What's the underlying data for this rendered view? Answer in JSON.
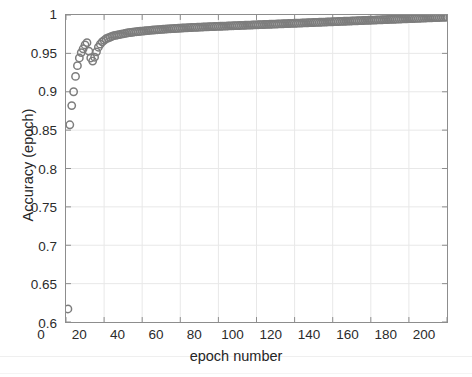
{
  "chart_data": {
    "type": "scatter",
    "title": "",
    "xlabel": "epoch number",
    "ylabel": "Accuracy (epoch)",
    "xlim": [
      0,
      200
    ],
    "ylim": [
      0.6,
      1
    ],
    "xticks": [
      0,
      20,
      40,
      60,
      80,
      100,
      120,
      140,
      160,
      180,
      200
    ],
    "xtick_labels": [
      "0",
      "20",
      "40",
      "60",
      "80",
      "100",
      "120",
      "140",
      "160",
      "180",
      "200"
    ],
    "yticks": [
      0.6,
      0.65,
      0.7,
      0.75,
      0.8,
      0.85,
      0.9,
      0.95,
      1
    ],
    "ytick_labels": [
      "0.6",
      "0.65",
      "0.7",
      "0.75",
      "0.8",
      "0.85",
      "0.9",
      "0.95",
      "1"
    ],
    "grid": true,
    "legend": null,
    "marker": "open-circle",
    "marker_color": "#7d7d7d",
    "marker_size": 5,
    "series": [
      {
        "name": "Accuracy (epoch)",
        "x": [
          1,
          2,
          3,
          4,
          5,
          6,
          7,
          8,
          9,
          10,
          11,
          12,
          13,
          14,
          15,
          16,
          17,
          18,
          19,
          20,
          21,
          22,
          23,
          24,
          25,
          26,
          27,
          28,
          29,
          30,
          31,
          32,
          33,
          34,
          35,
          36,
          37,
          38,
          39,
          40,
          41,
          42,
          43,
          44,
          45,
          46,
          47,
          48,
          49,
          50,
          51,
          52,
          53,
          54,
          55,
          56,
          57,
          58,
          59,
          60,
          61,
          62,
          63,
          64,
          65,
          66,
          67,
          68,
          69,
          70,
          71,
          72,
          73,
          74,
          75,
          76,
          77,
          78,
          79,
          80,
          81,
          82,
          83,
          84,
          85,
          86,
          87,
          88,
          89,
          90,
          91,
          92,
          93,
          94,
          95,
          96,
          97,
          98,
          99,
          100,
          101,
          102,
          103,
          104,
          105,
          106,
          107,
          108,
          109,
          110,
          111,
          112,
          113,
          114,
          115,
          116,
          117,
          118,
          119,
          120,
          121,
          122,
          123,
          124,
          125,
          126,
          127,
          128,
          129,
          130,
          131,
          132,
          133,
          134,
          135,
          136,
          137,
          138,
          139,
          140,
          141,
          142,
          143,
          144,
          145,
          146,
          147,
          148,
          149,
          150,
          151,
          152,
          153,
          154,
          155,
          156,
          157,
          158,
          159,
          160,
          161,
          162,
          163,
          164,
          165,
          166,
          167,
          168,
          169,
          170,
          171,
          172,
          173,
          174,
          175,
          176,
          177,
          178,
          179,
          180,
          181,
          182,
          183,
          184,
          185,
          186,
          187,
          188,
          189,
          190,
          191,
          192,
          193,
          194,
          195,
          196,
          197,
          198,
          199,
          200
        ],
        "y": [
          0.617,
          0.857,
          0.882,
          0.9,
          0.92,
          0.934,
          0.944,
          0.951,
          0.956,
          0.961,
          0.964,
          0.953,
          0.944,
          0.94,
          0.945,
          0.952,
          0.958,
          0.962,
          0.965,
          0.967,
          0.969,
          0.97,
          0.971,
          0.972,
          0.973,
          0.9735,
          0.974,
          0.9745,
          0.975,
          0.9755,
          0.976,
          0.9765,
          0.977,
          0.9772,
          0.9775,
          0.978,
          0.9782,
          0.9785,
          0.9788,
          0.979,
          0.9792,
          0.9795,
          0.9797,
          0.98,
          0.9802,
          0.9804,
          0.9806,
          0.9808,
          0.981,
          0.9812,
          0.9814,
          0.9816,
          0.9818,
          0.982,
          0.9821,
          0.9823,
          0.9824,
          0.9826,
          0.9827,
          0.9829,
          0.983,
          0.9832,
          0.9833,
          0.9834,
          0.9836,
          0.9837,
          0.9838,
          0.9839,
          0.984,
          0.9842,
          0.9843,
          0.9844,
          0.9845,
          0.9846,
          0.9847,
          0.9848,
          0.9849,
          0.985,
          0.9851,
          0.9852,
          0.9853,
          0.9854,
          0.9855,
          0.9856,
          0.9857,
          0.9858,
          0.9859,
          0.986,
          0.9861,
          0.9862,
          0.9863,
          0.9864,
          0.9865,
          0.9866,
          0.9867,
          0.9868,
          0.9869,
          0.987,
          0.9871,
          0.9872,
          0.9873,
          0.9874,
          0.9875,
          0.9876,
          0.9877,
          0.9878,
          0.9879,
          0.988,
          0.9881,
          0.9882,
          0.9883,
          0.9884,
          0.9885,
          0.9886,
          0.9887,
          0.9888,
          0.9889,
          0.989,
          0.9891,
          0.9892,
          0.9893,
          0.9894,
          0.9895,
          0.9896,
          0.9897,
          0.9898,
          0.9899,
          0.99,
          0.9901,
          0.9902,
          0.9903,
          0.9904,
          0.9905,
          0.9906,
          0.9907,
          0.9908,
          0.9909,
          0.991,
          0.9911,
          0.9912,
          0.9913,
          0.9914,
          0.9915,
          0.9916,
          0.9917,
          0.9918,
          0.9919,
          0.992,
          0.9921,
          0.9922,
          0.9923,
          0.9924,
          0.9925,
          0.9926,
          0.9927,
          0.9928,
          0.9929,
          0.993,
          0.9931,
          0.9932,
          0.9933,
          0.9934,
          0.9935,
          0.9936,
          0.9937,
          0.9938,
          0.9939,
          0.994,
          0.9941,
          0.9942,
          0.9943,
          0.9944,
          0.9945,
          0.9946,
          0.9947,
          0.9948,
          0.9949,
          0.995,
          0.9951,
          0.9952,
          0.9953,
          0.9954,
          0.9955,
          0.9956,
          0.9957,
          0.9958,
          0.9959,
          0.996,
          0.9961,
          0.9962,
          0.9963,
          0.9964,
          0.9965,
          0.9966,
          0.9967,
          0.9968,
          0.9969,
          0.997,
          0.9971,
          0.9972
        ]
      }
    ]
  },
  "style": {
    "axis_color": "#8d8d8d",
    "grid_color": "#e8e8e8",
    "text_color": "#2b2b2b",
    "background": "#ffffff"
  }
}
